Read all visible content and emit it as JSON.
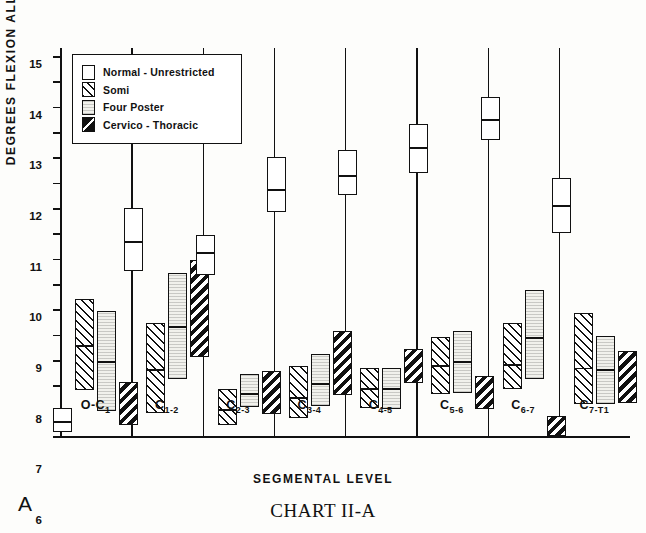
{
  "panel_letter": "A",
  "caption": {
    "prefix": "C",
    "rest": "HART",
    "suffix": " II-A",
    "full": "CHART II-A"
  },
  "axes": {
    "ylabel": "DEGREES FLEXION ALLOWED",
    "xlabel": "SEGMENTAL LEVEL",
    "yticks": [
      "0",
      "1",
      "2",
      "3",
      "4",
      "5",
      "6",
      "7",
      "8",
      "9",
      "10",
      "11",
      "12",
      "13",
      "14",
      "15"
    ]
  },
  "legend": {
    "items": [
      {
        "label": "Normal - Unrestricted",
        "fill": "normal"
      },
      {
        "label": "Somi",
        "fill": "somi"
      },
      {
        "label": "Four Poster",
        "fill": "four"
      },
      {
        "label": "Cervico - Thoracic",
        "fill": "cervico"
      }
    ]
  },
  "chart_data": {
    "type": "bar",
    "title": "CHART II-A",
    "xlabel": "SEGMENTAL LEVEL",
    "ylabel": "DEGREES FLEXION ALLOWED",
    "ylim": [
      0,
      15
    ],
    "grid": false,
    "legend_position": "upper-left-inset",
    "note": "Floating box (range) bars with an internal horizontal mean line; values in degrees of flexion.",
    "categories": [
      "O-C1",
      "C1-2",
      "C2-3",
      "C3-4",
      "C4-5",
      "C5-6",
      "C6-7",
      "C7-T1"
    ],
    "category_labels": [
      {
        "base": "O-C",
        "sub": "1"
      },
      {
        "base": "C",
        "sub": "1-2"
      },
      {
        "base": "C",
        "sub": "2-3"
      },
      {
        "base": "C",
        "sub": "3-4"
      },
      {
        "base": "C",
        "sub": "4-5"
      },
      {
        "base": "C",
        "sub": "5-6"
      },
      {
        "base": "C",
        "sub": "6-7"
      },
      {
        "base": "C",
        "sub": "7-T1"
      }
    ],
    "series": [
      {
        "name": "Normal - Unrestricted",
        "fill": "normal",
        "boxes": [
          {
            "low": 0.15,
            "high": 1.1,
            "mean": 0.6
          },
          {
            "low": 6.5,
            "high": 9.0,
            "mean": 7.7
          },
          {
            "low": 6.35,
            "high": 7.95,
            "mean": 7.25
          },
          {
            "low": 8.85,
            "high": 11.0,
            "mean": 9.75
          },
          {
            "low": 9.5,
            "high": 11.3,
            "mean": 10.3
          },
          {
            "low": 10.4,
            "high": 12.3,
            "mean": 11.4
          },
          {
            "low": 11.7,
            "high": 13.4,
            "mean": 12.5
          },
          {
            "low": 8.0,
            "high": 10.2,
            "mean": 9.1
          }
        ]
      },
      {
        "name": "Somi",
        "fill": "somi",
        "boxes": [
          {
            "low": 1.8,
            "high": 5.4,
            "mean": 3.6
          },
          {
            "low": 0.9,
            "high": 4.45,
            "mean": 2.65
          },
          {
            "low": 0.45,
            "high": 1.85,
            "mean": 1.05
          },
          {
            "low": 0.7,
            "high": 2.75,
            "mean": 1.55
          },
          {
            "low": 1.1,
            "high": 2.7,
            "mean": 1.9
          },
          {
            "low": 1.65,
            "high": 3.9,
            "mean": 2.8
          },
          {
            "low": 1.85,
            "high": 4.45,
            "mean": 2.85
          },
          {
            "low": 1.25,
            "high": 4.85,
            "mean": 2.7
          }
        ]
      },
      {
        "name": "Four Poster",
        "fill": "four",
        "boxes": [
          {
            "low": 1.0,
            "high": 4.95,
            "mean": 2.95
          },
          {
            "low": 2.25,
            "high": 6.45,
            "mean": 4.35
          },
          {
            "low": 1.15,
            "high": 2.45,
            "mean": 1.7
          },
          {
            "low": 1.2,
            "high": 3.25,
            "mean": 2.1
          },
          {
            "low": 1.05,
            "high": 2.7,
            "mean": 1.9
          },
          {
            "low": 1.7,
            "high": 4.15,
            "mean": 2.95
          },
          {
            "low": 2.25,
            "high": 5.75,
            "mean": 3.9
          },
          {
            "low": 1.25,
            "high": 3.95,
            "mean": 2.65
          }
        ]
      },
      {
        "name": "Cervico - Thoracic",
        "fill": "cervico",
        "boxes": [
          {
            "low": 0.45,
            "high": 2.15,
            "mean": null
          },
          {
            "low": 3.1,
            "high": 6.95,
            "mean": null
          },
          {
            "low": 0.85,
            "high": 2.55,
            "mean": null
          },
          {
            "low": 1.6,
            "high": 4.15,
            "mean": null
          },
          {
            "low": 2.1,
            "high": 3.45,
            "mean": null
          },
          {
            "low": 1.05,
            "high": 2.35,
            "mean": null
          },
          {
            "low": 0.0,
            "high": 0.8,
            "mean": null
          },
          {
            "low": 1.3,
            "high": 3.35,
            "mean": null
          }
        ]
      }
    ]
  }
}
